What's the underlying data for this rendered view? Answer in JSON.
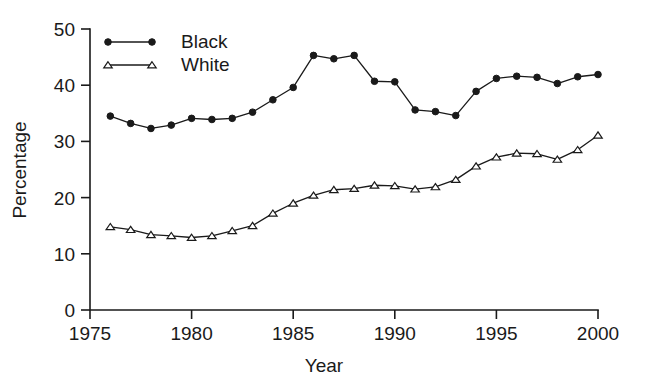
{
  "chart_data": {
    "type": "line",
    "title": "",
    "xlabel": "Year",
    "ylabel": "Percentage",
    "xlim": [
      1975,
      2000
    ],
    "ylim": [
      0,
      50
    ],
    "xticks": [
      1975,
      1980,
      1985,
      1990,
      1995,
      2000
    ],
    "yticks": [
      0,
      10,
      20,
      30,
      40,
      50
    ],
    "xtick_labels": [
      "1975",
      "1980",
      "1985",
      "1990",
      "1995",
      "2000"
    ],
    "ytick_labels": [
      "0",
      "10",
      "20",
      "30",
      "40",
      "50"
    ],
    "grid": false,
    "legend_position": "top-left",
    "x": [
      1976,
      1977,
      1978,
      1979,
      1980,
      1981,
      1982,
      1983,
      1984,
      1985,
      1986,
      1987,
      1988,
      1989,
      1990,
      1991,
      1992,
      1993,
      1994,
      1995,
      1996,
      1997,
      1998,
      1999,
      2000
    ],
    "series": [
      {
        "name": "Black",
        "marker": "filled-circle",
        "color": "#1a1a1a",
        "values": [
          34.5,
          33.2,
          32.3,
          32.9,
          34.1,
          33.9,
          34.1,
          35.2,
          37.4,
          39.6,
          45.3,
          44.7,
          45.3,
          40.7,
          40.6,
          35.6,
          35.3,
          34.6,
          38.9,
          41.2,
          41.6,
          41.4,
          40.3,
          41.5,
          41.9
        ]
      },
      {
        "name": "White",
        "marker": "open-triangle",
        "color": "#1a1a1a",
        "values": [
          14.8,
          14.3,
          13.4,
          13.2,
          12.9,
          13.2,
          14.1,
          15.0,
          17.2,
          19.0,
          20.4,
          21.4,
          21.6,
          22.2,
          22.1,
          21.5,
          21.9,
          23.2,
          25.6,
          27.2,
          27.9,
          27.8,
          26.8,
          28.5,
          31.1
        ]
      }
    ]
  },
  "legend": {
    "entries": [
      {
        "label": "Black"
      },
      {
        "label": "White"
      }
    ]
  },
  "axes": {
    "x_title": "Year",
    "y_title": "Percentage"
  }
}
